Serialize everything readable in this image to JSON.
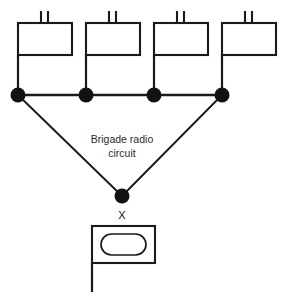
{
  "diagram": {
    "background_color": "#ffffff",
    "line_color": "#1a1a1a",
    "node_color": "#111111",
    "text_color": "#2b2b2b",
    "circuit_label": {
      "line1": "Brigade radio",
      "line2": "circuit",
      "x": 122,
      "y1": 140,
      "y2": 154
    },
    "brigade_designator": {
      "text": "X",
      "x": 122,
      "y": 216
    },
    "subordinate_units": [
      {
        "name": "battalion-unit-1",
        "echelon_ticks": 2,
        "rect": {
          "x": 18,
          "y": 23,
          "width": 54,
          "height": 32
        },
        "staff": {
          "x": 18,
          "y_top": 55,
          "y_bottom": 95
        },
        "node": {
          "cx": 18,
          "cy": 95,
          "r": 7.5
        }
      },
      {
        "name": "battalion-unit-2",
        "echelon_ticks": 2,
        "rect": {
          "x": 86,
          "y": 23,
          "width": 54,
          "height": 32
        },
        "staff": {
          "x": 86,
          "y_top": 55,
          "y_bottom": 95
        },
        "node": {
          "cx": 86,
          "cy": 95,
          "r": 7.5
        }
      },
      {
        "name": "battalion-unit-3",
        "echelon_ticks": 2,
        "rect": {
          "x": 154,
          "y": 23,
          "width": 54,
          "height": 32
        },
        "staff": {
          "x": 154,
          "y_top": 55,
          "y_bottom": 95
        },
        "node": {
          "cx": 154,
          "cy": 95,
          "r": 7.5
        }
      },
      {
        "name": "battalion-unit-4",
        "echelon_ticks": 2,
        "rect": {
          "x": 222,
          "y": 23,
          "width": 54,
          "height": 32
        },
        "staff": {
          "x": 222,
          "y_top": 55,
          "y_bottom": 95
        },
        "node": {
          "cx": 222,
          "cy": 95,
          "r": 7.5
        }
      }
    ],
    "trunk_line": {
      "x1": 18,
      "y1": 95,
      "x2": 222,
      "y2": 95
    },
    "branch_lines": [
      {
        "name": "branch-left",
        "x1": 18,
        "y1": 95,
        "x2": 122,
        "y2": 196
      },
      {
        "name": "branch-right",
        "x1": 222,
        "y1": 95,
        "x2": 122,
        "y2": 196
      }
    ],
    "vertex_node": {
      "cx": 122,
      "cy": 196,
      "r": 7.5
    },
    "headquarters": {
      "name": "brigade-headquarters",
      "rect": {
        "x": 92,
        "y": 226,
        "width": 63,
        "height": 37
      },
      "inner_stadium": {
        "x": 101,
        "y": 234,
        "width": 45,
        "height": 21,
        "radius": 10.5
      },
      "staff": {
        "x": 92,
        "y_top": 263,
        "y_bottom": 292
      }
    }
  }
}
